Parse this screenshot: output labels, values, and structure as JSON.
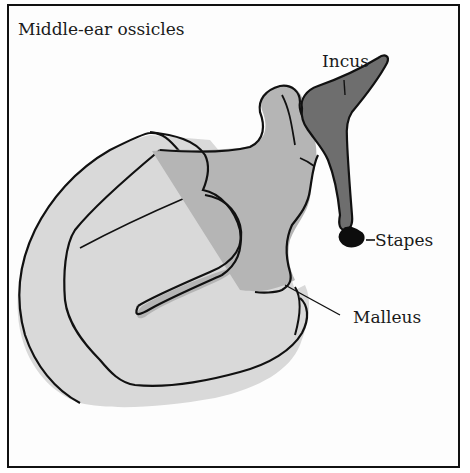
{
  "title": "Middle-ear ossicles",
  "labels": {
    "incus": "Incus",
    "stapes": "Stapes",
    "malleus": "Malleus"
  },
  "colors": {
    "border": "#111111",
    "eardrum_fill": "#d9d9d9",
    "malleus_fill": "#b5b5b5",
    "incus_fill": "#6e6e6e",
    "stapes_fill": "#0d0d0d",
    "outline": "#111111"
  }
}
